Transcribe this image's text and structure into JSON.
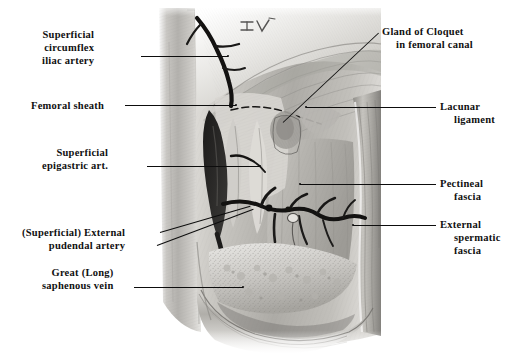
{
  "plate": {
    "title": "Femoral Triangle Dissection",
    "figure_mark": "IV",
    "background_color": "#ffffff",
    "ink_color": "#0d0d0d"
  },
  "labels_left": [
    {
      "name": "superficial-circumflex-iliac-artery",
      "lines": [
        "Superficial",
        "circumflex",
        "iliac artery"
      ],
      "x": 28,
      "y": 28,
      "leader": {
        "x1": 141,
        "y1": 56,
        "x2": 228,
        "y2": 56
      }
    },
    {
      "name": "femoral-sheath",
      "lines": [
        "Femoral sheath"
      ],
      "x": 31,
      "y": 99,
      "leader": {
        "x1": 125,
        "y1": 105,
        "x2": 236,
        "y2": 105
      }
    },
    {
      "name": "superficial-epigastric-artery",
      "lines": [
        "Superficial",
        "epigastric art."
      ],
      "x": 28,
      "y": 146,
      "leader": {
        "x1": 147,
        "y1": 166,
        "x2": 260,
        "y2": 166
      }
    },
    {
      "name": "superficial-external-pudendal-artery",
      "lines": [
        "(Superficial) External",
        "pudendal artery"
      ],
      "x": 22,
      "y": 226,
      "leader": {
        "x1": 160,
        "y1": 232,
        "x2": 250,
        "y2": 205
      },
      "leader2": {
        "x1": 157,
        "y1": 245,
        "x2": 252,
        "y2": 208
      }
    },
    {
      "name": "great-long-saphenous-vein",
      "lines": [
        "Great (Long)",
        "saphenous vein"
      ],
      "x": 28,
      "y": 266,
      "leader": {
        "x1": 134,
        "y1": 287,
        "x2": 243,
        "y2": 287
      }
    }
  ],
  "labels_right": [
    {
      "name": "gland-of-cloquet-in-femoral-canal",
      "lines": [
        "Gland of Cloquet",
        "in femoral canal"
      ],
      "x": 382,
      "y": 27,
      "leader": {
        "x1": 378,
        "y1": 33,
        "x2": 283,
        "y2": 122
      }
    },
    {
      "name": "lacunar-ligament",
      "lines": [
        "Lacunar",
        "ligament"
      ],
      "x": 440,
      "y": 101,
      "leader": {
        "x1": 436,
        "y1": 107,
        "x2": 306,
        "y2": 107
      }
    },
    {
      "name": "pectineal-fascia",
      "lines": [
        "Pectineal",
        "fascia"
      ],
      "x": 440,
      "y": 178,
      "leader": {
        "x1": 436,
        "y1": 184,
        "x2": 300,
        "y2": 184
      }
    },
    {
      "name": "external-spermatic-fascia",
      "lines": [
        "External",
        "spermatic",
        "fascia"
      ],
      "x": 440,
      "y": 219,
      "leader": {
        "x1": 436,
        "y1": 225,
        "x2": 353,
        "y2": 225
      }
    }
  ]
}
